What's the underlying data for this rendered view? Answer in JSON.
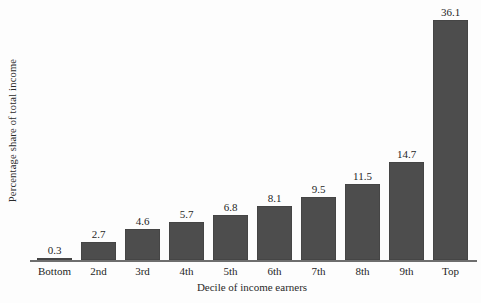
{
  "chart_data": {
    "type": "bar",
    "title": "",
    "subtitle": "",
    "xlabel": "Decile of income earners",
    "ylabel": "Percentage share of total income",
    "categories": [
      "Bottom",
      "2nd",
      "3rd",
      "4th",
      "5th",
      "6th",
      "7th",
      "8th",
      "9th",
      "Top"
    ],
    "values": [
      0.3,
      2.7,
      4.6,
      5.7,
      6.8,
      8.1,
      9.5,
      11.5,
      14.7,
      36.1
    ],
    "value_labels": [
      "0.3",
      "2.7",
      "4.6",
      "5.7",
      "6.8",
      "8.1",
      "9.5",
      "11.5",
      "14.7",
      "36.1"
    ],
    "ylim": [
      0,
      36.1
    ],
    "grid": false,
    "legend": false,
    "legend_position": "none",
    "y_ticks_visible": false,
    "x_axis_line": true,
    "bar_color": "#4d4d4d",
    "background_color": "#fdfdfd",
    "text_color": "#1f1f1f"
  }
}
